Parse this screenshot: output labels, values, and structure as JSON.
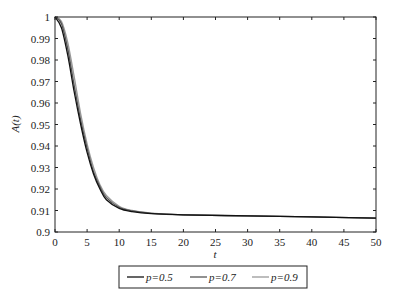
{
  "chart_data": {
    "type": "line",
    "title": "",
    "xlabel": "t",
    "ylabel": "A(t)",
    "xlim": [
      0,
      50
    ],
    "ylim": [
      0.9,
      1.0
    ],
    "xticks": [
      "0",
      "5",
      "10",
      "15",
      "20",
      "25",
      "30",
      "35",
      "40",
      "45",
      "50"
    ],
    "yticks": [
      "0.9",
      "0.91",
      "0.92",
      "0.93",
      "0.94",
      "0.95",
      "0.96",
      "0.97",
      "0.98",
      "0.99",
      "1"
    ],
    "grid": false,
    "legend_position": "bottom",
    "x": [
      0,
      1,
      2,
      3,
      4,
      5,
      6,
      7,
      8,
      10,
      12,
      15,
      20,
      30,
      40,
      50
    ],
    "series": [
      {
        "name": "p=0.5",
        "color": "#111111",
        "values": [
          1.0,
          0.995,
          0.982,
          0.965,
          0.95,
          0.937,
          0.927,
          0.92,
          0.915,
          0.911,
          0.9095,
          0.9085,
          0.908,
          0.9075,
          0.907,
          0.9065
        ]
      },
      {
        "name": "p=0.7",
        "color": "#555555",
        "values": [
          1.0,
          0.997,
          0.985,
          0.968,
          0.952,
          0.939,
          0.928,
          0.921,
          0.916,
          0.9115,
          0.9098,
          0.9087,
          0.908,
          0.9075,
          0.907,
          0.9065
        ]
      },
      {
        "name": "p=0.9",
        "color": "#999999",
        "values": [
          1.0,
          0.998,
          0.988,
          0.972,
          0.955,
          0.941,
          0.93,
          0.922,
          0.917,
          0.912,
          0.91,
          0.9088,
          0.908,
          0.9075,
          0.907,
          0.9065
        ]
      }
    ]
  },
  "legend": {
    "items": [
      {
        "label": "p=0.5"
      },
      {
        "label": "p=0.7"
      },
      {
        "label": "p=0.9"
      }
    ]
  }
}
